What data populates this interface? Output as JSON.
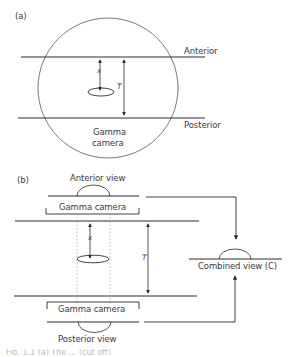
{
  "figure": {
    "panel_a": {
      "label": "(a)",
      "top_line_label": "Anterior",
      "bottom_line_label": "Posterior",
      "circle_label_line1": "Gamma",
      "circle_label_line2": "camera",
      "depth_symbol": "x",
      "thickness_symbol": "T"
    },
    "panel_b": {
      "label": "(b)",
      "anterior_view_label": "Anterior view",
      "top_camera_label": "Gamma camera",
      "bottom_camera_label": "Gamma camera",
      "posterior_view_label": "Posterior view",
      "combined_view_label": "Combined view (C)",
      "depth_symbol": "x",
      "thickness_symbol": "T"
    },
    "caption_fragment": "Fig. 1.1 (a) The ... (cut off)"
  },
  "colors": {
    "line": "#2a2a2a",
    "dotted": "#9a9a9a",
    "text": "#3a3a3a"
  }
}
